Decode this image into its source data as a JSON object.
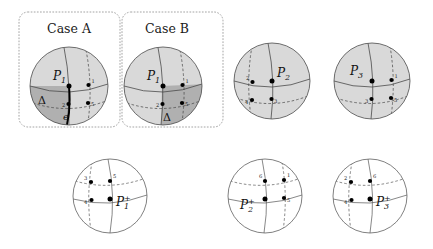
{
  "figure": {
    "background": "#ffffff",
    "sphere_fill_light": "#d9d9d9",
    "sphere_fill_dark": "#b0b0b0",
    "sphere_fill_plain": "#ffffff",
    "stroke": "#4a4a4a",
    "accent_edge": "#000000"
  },
  "cases": [
    {
      "id": "case-a",
      "label": "Case A"
    },
    {
      "id": "case-b",
      "label": "Case B"
    }
  ],
  "top_row": [
    {
      "id": "sphere-case-a",
      "center_label": "P",
      "center_sub": "1",
      "center_sup": "",
      "region_label": "Δ",
      "edge_label": "e",
      "shaded": true,
      "dark_quadrant": "lower-left",
      "bold_edge": true,
      "dashed_meridian_side": "right",
      "vertex_numbers": [
        "1",
        "2",
        "5"
      ]
    },
    {
      "id": "sphere-case-b",
      "center_label": "P",
      "center_sub": "1",
      "center_sup": "",
      "region_label": "Δ",
      "edge_label": "",
      "shaded": true,
      "dark_quadrant": "lower-right",
      "bold_edge": false,
      "dashed_meridian_side": "right",
      "vertex_numbers": [
        "1",
        "2",
        "5"
      ]
    },
    {
      "id": "sphere-p2",
      "center_label": "P",
      "center_sub": "2",
      "center_sup": "",
      "region_label": "",
      "edge_label": "",
      "shaded": true,
      "dark_quadrant": "none",
      "bold_edge": false,
      "dashed_meridian_side": "left",
      "vertex_numbers": [
        "2",
        "3",
        "4"
      ]
    },
    {
      "id": "sphere-p3",
      "center_label": "P",
      "center_sub": "3",
      "center_sup": "",
      "region_label": "",
      "edge_label": "",
      "shaded": true,
      "dark_quadrant": "none",
      "bold_edge": false,
      "dashed_meridian_side": "right",
      "vertex_numbers": [
        "1",
        "3",
        "5"
      ]
    }
  ],
  "bottom_row": [
    {
      "id": "sphere-p1-plus",
      "center_label": "P",
      "center_sub": "1",
      "center_sup": "+",
      "shaded": false,
      "dashed_meridian_side": "left",
      "vertex_numbers": [
        "3",
        "4",
        "5"
      ]
    },
    {
      "id": "sphere-p2-plus",
      "center_label": "P",
      "center_sub": "2",
      "center_sup": "+",
      "shaded": false,
      "dashed_meridian_side": "right",
      "vertex_numbers": [
        "1",
        "5",
        "6"
      ]
    },
    {
      "id": "sphere-p3-plus",
      "center_label": "P",
      "center_sub": "3",
      "center_sup": "+",
      "shaded": false,
      "dashed_meridian_side": "left",
      "vertex_numbers": [
        "2",
        "4",
        "6"
      ]
    }
  ],
  "labels": {
    "case_a": "Case A",
    "case_b": "Case B",
    "delta": "Δ",
    "edge_e": "e",
    "p": "P",
    "plus": "+",
    "n1": "1",
    "n2": "2",
    "n3": "3",
    "n4": "4",
    "n5": "5",
    "n6": "6"
  }
}
